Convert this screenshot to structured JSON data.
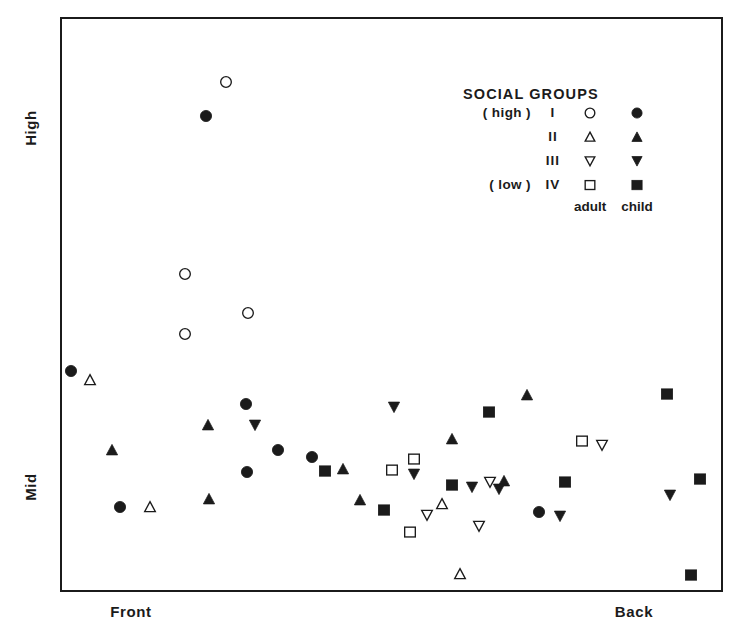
{
  "chart_data": {
    "type": "scatter",
    "title": "SOCIAL GROUPS",
    "xlabel": "",
    "ylabel": "",
    "x_tick_labels": [
      "Front",
      "Back"
    ],
    "y_tick_labels": [
      "High",
      "Mid"
    ],
    "grid": false,
    "legend_position": "upper-right-inside",
    "axis_note": "Unscaled categorical axes: x from Front (left) to Back (right); y from Mid (low) to High (top)",
    "series": [
      {
        "name": "I adult",
        "group": "I",
        "age": "adult",
        "marker": "open-circle",
        "points": [
          {
            "x": 224,
            "y": 80
          },
          {
            "x": 183,
            "y": 272
          },
          {
            "x": 246,
            "y": 311
          },
          {
            "x": 183,
            "y": 332
          }
        ]
      },
      {
        "name": "I child",
        "group": "I",
        "age": "child",
        "marker": "filled-circle",
        "points": [
          {
            "x": 204,
            "y": 114
          },
          {
            "x": 69,
            "y": 369
          },
          {
            "x": 244,
            "y": 402
          },
          {
            "x": 276,
            "y": 448
          },
          {
            "x": 245,
            "y": 470
          },
          {
            "x": 310,
            "y": 455
          },
          {
            "x": 118,
            "y": 505
          },
          {
            "x": 537,
            "y": 510
          }
        ]
      },
      {
        "name": "II adult",
        "group": "II",
        "age": "adult",
        "marker": "open-triangle-up",
        "points": [
          {
            "x": 88,
            "y": 378
          },
          {
            "x": 148,
            "y": 505
          },
          {
            "x": 440,
            "y": 502
          },
          {
            "x": 458,
            "y": 572
          }
        ]
      },
      {
        "name": "II child",
        "group": "II",
        "age": "child",
        "marker": "filled-triangle-up",
        "points": [
          {
            "x": 110,
            "y": 448
          },
          {
            "x": 206,
            "y": 423
          },
          {
            "x": 207,
            "y": 497
          },
          {
            "x": 341,
            "y": 467
          },
          {
            "x": 358,
            "y": 498
          },
          {
            "x": 450,
            "y": 437
          },
          {
            "x": 502,
            "y": 479
          },
          {
            "x": 525,
            "y": 393
          }
        ]
      },
      {
        "name": "III adult",
        "group": "III",
        "age": "adult",
        "marker": "open-triangle-down",
        "points": [
          {
            "x": 425,
            "y": 513
          },
          {
            "x": 477,
            "y": 524
          },
          {
            "x": 488,
            "y": 480
          },
          {
            "x": 600,
            "y": 443
          }
        ]
      },
      {
        "name": "III child",
        "group": "III",
        "age": "child",
        "marker": "filled-triangle-down",
        "points": [
          {
            "x": 253,
            "y": 423
          },
          {
            "x": 392,
            "y": 405
          },
          {
            "x": 412,
            "y": 472
          },
          {
            "x": 470,
            "y": 485
          },
          {
            "x": 497,
            "y": 487
          },
          {
            "x": 558,
            "y": 514
          },
          {
            "x": 668,
            "y": 493
          }
        ]
      },
      {
        "name": "IV adult",
        "group": "IV",
        "age": "adult",
        "marker": "open-square",
        "points": [
          {
            "x": 390,
            "y": 468
          },
          {
            "x": 412,
            "y": 457
          },
          {
            "x": 408,
            "y": 530
          },
          {
            "x": 580,
            "y": 439
          }
        ]
      },
      {
        "name": "IV child",
        "group": "IV",
        "age": "child",
        "marker": "filled-square",
        "points": [
          {
            "x": 323,
            "y": 469
          },
          {
            "x": 382,
            "y": 508
          },
          {
            "x": 450,
            "y": 483
          },
          {
            "x": 487,
            "y": 410
          },
          {
            "x": 563,
            "y": 480
          },
          {
            "x": 665,
            "y": 392
          },
          {
            "x": 698,
            "y": 477
          },
          {
            "x": 689,
            "y": 573
          }
        ]
      }
    ]
  },
  "axes": {
    "y_high_label": "High",
    "y_mid_label": "Mid",
    "x_front_label": "Front",
    "x_back_label": "Back"
  },
  "legend": {
    "title": "SOCIAL GROUPS",
    "adult_column_label": "adult",
    "child_column_label": "child",
    "rows": [
      {
        "qualifier": "( high )",
        "roman": "I",
        "adult_marker": "open-circle",
        "child_marker": "filled-circle"
      },
      {
        "qualifier": "",
        "roman": "II",
        "adult_marker": "open-triangle-up",
        "child_marker": "filled-triangle-up"
      },
      {
        "qualifier": "",
        "roman": "III",
        "adult_marker": "open-triangle-down",
        "child_marker": "filled-triangle-down"
      },
      {
        "qualifier": "( low )",
        "roman": "IV",
        "adult_marker": "open-square",
        "child_marker": "filled-square"
      }
    ]
  },
  "style": {
    "ink_color": "#1b1b1b",
    "background_color": "#ffffff"
  }
}
